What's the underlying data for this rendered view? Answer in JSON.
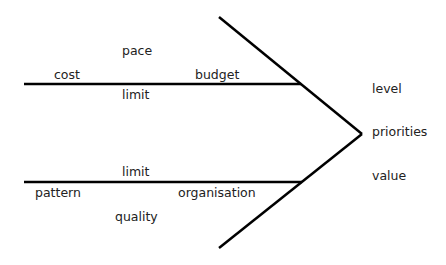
{
  "diagram": {
    "type": "fishbone",
    "head_labels": [
      "level",
      "priorities",
      "value"
    ],
    "upper_bone": {
      "above": [
        "cost",
        "budget"
      ],
      "top": "pace",
      "below": "limit"
    },
    "lower_bone": {
      "above": "limit",
      "below": [
        "pattern",
        "organisation"
      ],
      "bottom": "quality"
    },
    "line_color": "#000000"
  }
}
